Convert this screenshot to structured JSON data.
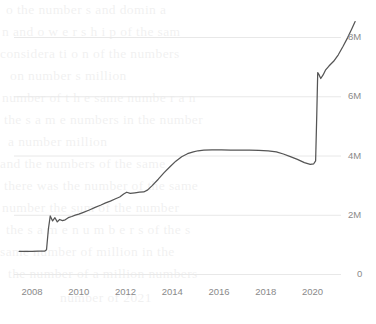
{
  "chart_data": {
    "type": "line",
    "title": "",
    "subtitle": "",
    "xlabel": "",
    "ylabel": "",
    "xlim": [
      2007.4,
      2021.9
    ],
    "ylim": [
      0,
      9000000
    ],
    "grid": true,
    "grid_axis": "y",
    "legend": "none",
    "y_tick_labels": [
      "0",
      "2M",
      "4M",
      "6M",
      "8M"
    ],
    "y_tick_values": [
      0,
      2000000,
      4000000,
      6000000,
      8000000
    ],
    "y_axis_position": "right",
    "x_tick_labels": [
      "2008",
      "2010",
      "2012",
      "2014",
      "2016",
      "2018",
      "2020"
    ],
    "x_tick_values": [
      2008,
      2010,
      2012,
      2014,
      2016,
      2018,
      2020
    ],
    "line_color": "#555555",
    "grid_color": "#e8e8e8",
    "tick_label_color": "#8a8a8a",
    "background_color": "#ffffff",
    "series": [
      {
        "name": "value",
        "x": [
          2007.45,
          2007.7,
          2008.0,
          2008.3,
          2008.55,
          2008.62,
          2008.7,
          2008.78,
          2008.88,
          2008.98,
          2009.08,
          2009.18,
          2009.3,
          2009.42,
          2009.55,
          2009.7,
          2009.85,
          2010.0,
          2010.2,
          2010.45,
          2010.7,
          2010.95,
          2011.15,
          2011.35,
          2011.55,
          2011.75,
          2011.92,
          2012.05,
          2012.2,
          2012.4,
          2012.6,
          2012.78,
          2012.95,
          2013.15,
          2013.4,
          2013.65,
          2013.9,
          2014.15,
          2014.4,
          2014.65,
          2014.9,
          2015.1,
          2015.35,
          2015.7,
          2016.1,
          2016.5,
          2016.9,
          2017.3,
          2017.7,
          2018.1,
          2018.45,
          2018.75,
          2019.05,
          2019.35,
          2019.65,
          2019.9,
          2020.05,
          2020.13,
          2020.18,
          2020.22,
          2020.28,
          2020.35,
          2020.45,
          2020.55,
          2020.7,
          2020.9,
          2021.1,
          2021.3,
          2021.5,
          2021.68,
          2021.82
        ],
        "values": [
          760000,
          760000,
          765000,
          770000,
          775000,
          820000,
          1520000,
          1960000,
          1790000,
          1900000,
          1760000,
          1840000,
          1800000,
          1830000,
          1900000,
          1940000,
          1990000,
          2020000,
          2080000,
          2160000,
          2250000,
          2330000,
          2400000,
          2460000,
          2530000,
          2600000,
          2700000,
          2760000,
          2720000,
          2740000,
          2760000,
          2770000,
          2840000,
          2990000,
          3200000,
          3420000,
          3620000,
          3810000,
          3960000,
          4060000,
          4120000,
          4160000,
          4180000,
          4190000,
          4190000,
          4185000,
          4185000,
          4180000,
          4175000,
          4160000,
          4120000,
          4050000,
          3960000,
          3870000,
          3760000,
          3700000,
          3720000,
          3820000,
          5400000,
          6800000,
          6720000,
          6600000,
          6720000,
          6880000,
          7020000,
          7180000,
          7400000,
          7680000,
          7980000,
          8280000,
          8520000
        ]
      }
    ]
  },
  "background_text": {
    "lines": [
      "o    the number s  and domin a",
      "n      and      o w e r s h i p  of  the  sam",
      "considera    ti   o n   of     the      numbers",
      "on      number        s  million",
      "number    of   t h e  same   numbe r  a  n",
      "the  s a m e  numbers in  the  number",
      "a   number    million",
      "and    the    numbers   of    the   same",
      "there  was  the  number  of   the  same",
      "number    the    sum  of     the   number",
      "the    s a m e    n u m b e r s  of  the   s",
      "same   number   of   million    in   the",
      "the  number  of  a  million  numbers",
      "number      of     2021"
    ]
  }
}
